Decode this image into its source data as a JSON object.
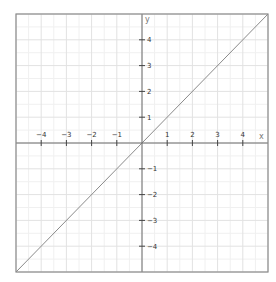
{
  "chart_data": {
    "type": "line",
    "title": "",
    "xlabel": "x",
    "ylabel": "y",
    "xlim": [
      -5,
      5
    ],
    "ylim": [
      -5,
      5
    ],
    "grid": true,
    "grid_minor_step": 0.5,
    "x_ticks": [
      -4,
      -3,
      -2,
      -1,
      1,
      2,
      3,
      4
    ],
    "y_ticks": [
      4,
      3,
      2,
      1,
      -1,
      -2,
      -3,
      -4
    ],
    "x_tick_labels": [
      "−4",
      "−3",
      "−2",
      "−1",
      "1",
      "2",
      "3",
      "4"
    ],
    "y_tick_labels": [
      "4",
      "3",
      "2",
      "1",
      "−1",
      "−2",
      "−3",
      "−4"
    ],
    "series": [
      {
        "name": "y = x",
        "x": [
          -5,
          5
        ],
        "y": [
          -5,
          5
        ],
        "color": "#8a8a8a"
      }
    ],
    "legend": null
  },
  "colors": {
    "border": "#8c8c8c",
    "axis": "#6e6e6e",
    "grid_major": "#e2e2e2",
    "grid_minor": "#f0f0f0",
    "line": "#8a8a8a"
  }
}
